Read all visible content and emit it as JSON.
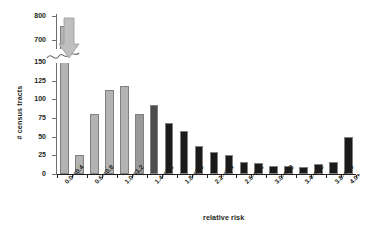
{
  "chart_data": {
    "type": "bar",
    "title": "",
    "xlabel": "relative risk",
    "ylabel": "# census tracts",
    "categories": [
      "0.0-<0.4",
      "0.4-<0.6",
      "0.6-<0.8",
      "0.8-<1.0",
      "1.0-<1.2",
      "1.2-<1.4",
      "1.4-<1.6",
      "1.6-<1.8",
      "1.8-<2.0",
      "2.0-<2.2",
      "2.2-<2.4",
      "2.4-<2.6",
      "2.6-<2.8",
      "2.8-<3.0",
      "3.0-<3.2",
      "3.2-<3.4",
      "3.4-<3.6",
      "3.6-<3.8",
      "3.8-<4.0",
      "4.0+"
    ],
    "values": [
      760,
      25,
      81,
      113,
      118,
      81,
      93,
      68,
      57,
      38,
      30,
      25,
      16,
      15,
      11,
      11,
      10,
      13,
      16,
      50
    ],
    "bar_colors": [
      "#b3b3b3",
      "#b3b3b3",
      "#b3b3b3",
      "#b3b3b3",
      "#b3b3b3",
      "#999999",
      "#4d4d4d",
      "#1a1a1a",
      "#1a1a1a",
      "#1a1a1a",
      "#1a1a1a",
      "#1a1a1a",
      "#1a1a1a",
      "#1a1a1a",
      "#1a1a1a",
      "#1a1a1a",
      "#1a1a1a",
      "#1a1a1a",
      "#1a1a1a",
      "#1a1a1a"
    ],
    "ytick_labels": [
      "0",
      "25",
      "50",
      "75",
      "100",
      "125",
      "150",
      "700",
      "800"
    ],
    "ytick_values": [
      0,
      25,
      50,
      75,
      100,
      125,
      150,
      700,
      800
    ],
    "ylim_lower": [
      0,
      150
    ],
    "ylim_upper": [
      690,
      810
    ],
    "axis_break": true,
    "axis_break_note": "y-axis broken between 150 and 700",
    "xtick_labels_shown": [
      "0.0-<0.4",
      "0.6-<0.8",
      "1.0-<1.2",
      "1.4-<1.6",
      "1.8-<2.0",
      "2.2-<2.4",
      "2.6-<2.8",
      "3.0-<3.2",
      "3.4-<3.6",
      "3.8-<4.0",
      "4.0+"
    ],
    "grid": false,
    "legend": "none",
    "annotation": "arrow pointing down at first bar across axis break"
  }
}
